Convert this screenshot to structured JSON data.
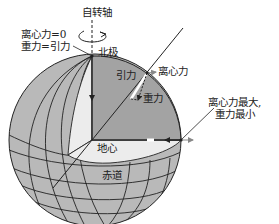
{
  "diagram": {
    "labels": {
      "rotation_axis": "自转轴",
      "pole_centrifugal": "离心力=0",
      "pole_gravity": "重力=引力",
      "north_pole": "北极",
      "gravitation": "引力",
      "centrifugal": "离心力",
      "gravity": "重力",
      "equator_line1": "离心力最大,",
      "equator_line2": "重力最小",
      "earth_center": "地心",
      "equator": "赤道"
    },
    "colors": {
      "sphere_gray": "#b9b9b9",
      "cutaway_dark": "#a3a3a3",
      "cutaway_light": "#ececec",
      "line": "#222222"
    }
  }
}
